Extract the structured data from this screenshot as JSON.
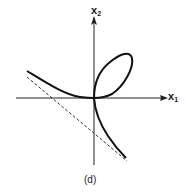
{
  "figure": {
    "caption": "(d)",
    "axes": {
      "x_label": "x",
      "x_sub": "1",
      "y_label": "x",
      "y_sub": "2"
    },
    "curve": "folium-like curve with loop in first quadrant and asymptote",
    "asymptote_style": "dashed"
  }
}
